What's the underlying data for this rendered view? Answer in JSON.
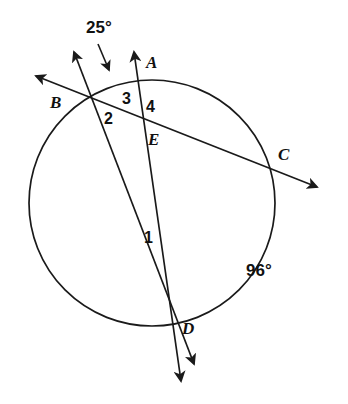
{
  "figure": {
    "type": "circle-geometry-diagram",
    "stroke_color": "#1a1a1a",
    "background_color": "#ffffff",
    "circle": {
      "cx": 152,
      "cy": 203,
      "r": 123
    },
    "points": [
      {
        "name": "A",
        "label": "A",
        "x": 140,
        "y": 84,
        "label_x": 146,
        "label_y": 54
      },
      {
        "name": "B",
        "label": "B",
        "x": 88,
        "y": 96,
        "label_x": 50,
        "label_y": 94
      },
      {
        "name": "C",
        "label": "C",
        "x": 277,
        "y": 168,
        "label_x": 278,
        "label_y": 146
      },
      {
        "name": "D",
        "label": "D",
        "x": 172,
        "y": 318,
        "label_x": 182,
        "label_y": 320
      },
      {
        "name": "E",
        "label": "E",
        "x": 147,
        "y": 127,
        "label_x": 148,
        "label_y": 131
      }
    ],
    "angle_numbers": [
      {
        "name": "angle-1",
        "label": "1",
        "x": 144,
        "y": 230
      },
      {
        "name": "angle-2",
        "label": "2",
        "x": 104,
        "y": 111
      },
      {
        "name": "angle-3",
        "label": "3",
        "x": 122,
        "y": 91
      },
      {
        "name": "angle-4",
        "label": "4",
        "x": 146,
        "y": 99
      }
    ],
    "arc_measures": [
      {
        "name": "arc-measure-25",
        "label": "25°",
        "x": 86,
        "y": 19,
        "points_to_x": 110,
        "points_to_y": 74
      },
      {
        "name": "arc-measure-96",
        "label": "96°",
        "x": 246,
        "y": 262
      }
    ],
    "rays": [
      {
        "name": "ray-b-to-upper-left",
        "from_x": 88,
        "from_y": 96,
        "to_x": 33,
        "to_y": 75
      },
      {
        "name": "ray-b-to-upper-right",
        "from_x": 88,
        "from_y": 96,
        "to_x": 72,
        "to_y": 48
      },
      {
        "name": "ray-secant-b-through-c",
        "from_x": 33,
        "from_y": 75,
        "to_x": 320,
        "to_y": 188
      },
      {
        "name": "ray-secant-a-through-d",
        "from_x": 133,
        "from_y": 48,
        "to_x": 182,
        "to_y": 385
      },
      {
        "name": "ray-secant-b-through-d",
        "from_x": 72,
        "from_y": 48,
        "to_x": 196,
        "to_y": 368
      }
    ]
  }
}
